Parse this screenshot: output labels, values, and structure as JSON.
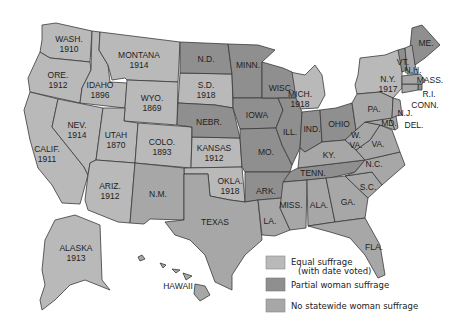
{
  "colors": {
    "equal": "#b9b9b9",
    "partial": "#8f8f8f",
    "none": "#a7a7a7",
    "border": "#3a3a3a",
    "background": "#ffffff"
  },
  "states": [
    {
      "abbr": "WASH.",
      "year": "1910",
      "status": "equal"
    },
    {
      "abbr": "ORE.",
      "year": "1912",
      "status": "equal"
    },
    {
      "abbr": "CALIF.",
      "year": "1911",
      "status": "equal"
    },
    {
      "abbr": "IDAHO",
      "year": "1896",
      "status": "equal"
    },
    {
      "abbr": "NEV.",
      "year": "1914",
      "status": "equal"
    },
    {
      "abbr": "MONTANA",
      "year": "1914",
      "status": "equal"
    },
    {
      "abbr": "WYO.",
      "year": "1869",
      "status": "equal"
    },
    {
      "abbr": "UTAH",
      "year": "1870",
      "status": "equal"
    },
    {
      "abbr": "COLO.",
      "year": "1893",
      "status": "equal"
    },
    {
      "abbr": "ARIZ.",
      "year": "1912",
      "status": "equal"
    },
    {
      "abbr": "N.M.",
      "year": "",
      "status": "none"
    },
    {
      "abbr": "N.D.",
      "year": "",
      "status": "partial"
    },
    {
      "abbr": "S.D.",
      "year": "1918",
      "status": "equal"
    },
    {
      "abbr": "NEBR.",
      "year": "",
      "status": "partial"
    },
    {
      "abbr": "KANSAS",
      "year": "1912",
      "status": "equal"
    },
    {
      "abbr": "OKLA.",
      "year": "1918",
      "status": "equal"
    },
    {
      "abbr": "TEXAS",
      "year": "",
      "status": "none"
    },
    {
      "abbr": "MINN.",
      "year": "",
      "status": "partial"
    },
    {
      "abbr": "IOWA",
      "year": "",
      "status": "partial"
    },
    {
      "abbr": "MO.",
      "year": "",
      "status": "partial"
    },
    {
      "abbr": "ARK.",
      "year": "",
      "status": "partial"
    },
    {
      "abbr": "LA.",
      "year": "",
      "status": "none"
    },
    {
      "abbr": "WISC.",
      "year": "",
      "status": "partial"
    },
    {
      "abbr": "ILL.",
      "year": "",
      "status": "partial"
    },
    {
      "abbr": "MICH.",
      "year": "1918",
      "status": "equal"
    },
    {
      "abbr": "IND.",
      "year": "",
      "status": "partial"
    },
    {
      "abbr": "OHIO",
      "year": "",
      "status": "partial"
    },
    {
      "abbr": "KY.",
      "year": "",
      "status": "none"
    },
    {
      "abbr": "TENN.",
      "year": "",
      "status": "partial"
    },
    {
      "abbr": "MISS.",
      "year": "",
      "status": "none"
    },
    {
      "abbr": "ALA.",
      "year": "",
      "status": "none"
    },
    {
      "abbr": "GA.",
      "year": "",
      "status": "none"
    },
    {
      "abbr": "FLA.",
      "year": "",
      "status": "none"
    },
    {
      "abbr": "S.C.",
      "year": "",
      "status": "none"
    },
    {
      "abbr": "N.C.",
      "year": "",
      "status": "none"
    },
    {
      "abbr": "VA.",
      "year": "",
      "status": "none"
    },
    {
      "abbr": "W. VA.",
      "year": "",
      "status": "none"
    },
    {
      "abbr": "MD.",
      "year": "",
      "status": "none"
    },
    {
      "abbr": "DEL.",
      "year": "",
      "status": "none"
    },
    {
      "abbr": "PA.",
      "year": "",
      "status": "none"
    },
    {
      "abbr": "N.J.",
      "year": "",
      "status": "none"
    },
    {
      "abbr": "N.Y.",
      "year": "1917",
      "status": "equal"
    },
    {
      "abbr": "CONN.",
      "year": "",
      "status": "none"
    },
    {
      "abbr": "R.I.",
      "year": "",
      "status": "partial"
    },
    {
      "abbr": "MASS.",
      "year": "",
      "status": "none"
    },
    {
      "abbr": "VT.",
      "year": "",
      "status": "partial"
    },
    {
      "abbr": "N.H.",
      "year": "",
      "status": "none"
    },
    {
      "abbr": "ME.",
      "year": "",
      "status": "partial"
    },
    {
      "abbr": "ALASKA",
      "year": "1913",
      "status": "equal"
    },
    {
      "abbr": "HAWAII",
      "year": "",
      "status": "none"
    }
  ],
  "labels": {
    "wash": "WASH.",
    "wash_y": "1910",
    "ore": "ORE.",
    "ore_y": "1912",
    "calif": "CALIF.",
    "calif_y": "1911",
    "idaho": "IDAHO",
    "idaho_y": "1896",
    "nev": "NEV.",
    "nev_y": "1914",
    "mont": "MONTANA",
    "mont_y": "1914",
    "wyo": "WYO.",
    "wyo_y": "1869",
    "utah": "UTAH",
    "utah_y": "1870",
    "colo": "COLO.",
    "colo_y": "1893",
    "ariz": "ARIZ.",
    "ariz_y": "1912",
    "nm": "N.M.",
    "nd": "N.D.",
    "sd": "S.D.",
    "sd_y": "1918",
    "nebr": "NEBR.",
    "kansas": "KANSAS",
    "kansas_y": "1912",
    "okla": "OKLA.",
    "okla_y": "1918",
    "texas": "TEXAS",
    "minn": "MINN.",
    "iowa": "IOWA",
    "mo": "MO.",
    "ark": "ARK.",
    "la": "LA.",
    "wisc": "WISC.",
    "ill": "ILL.",
    "mich": "MICH.",
    "mich_y": "1918",
    "ind": "IND.",
    "ohio": "OHIO",
    "ky": "KY.",
    "tenn": "TENN.",
    "miss": "MISS.",
    "ala": "ALA.",
    "ga": "GA.",
    "fla": "FLA.",
    "sc": "S.C.",
    "nc": "N.C.",
    "va": "VA.",
    "wva1": "W.",
    "wva2": "VA.",
    "md": "MD.",
    "del": "DEL.",
    "pa": "PA.",
    "nj": "N.J.",
    "ny": "N.Y.",
    "ny_y": "1917",
    "conn": "CONN.",
    "ri": "R.I.",
    "mass": "MASS.",
    "vt": "VT.",
    "nh": "N.H.",
    "me": "ME.",
    "alaska": "ALASKA",
    "alaska_y": "1913",
    "hawaii": "HAWAII"
  },
  "legend": {
    "items": [
      {
        "label": "Equal suffrage",
        "sublabel": "(with date voted)",
        "status": "equal"
      },
      {
        "label": "Partial woman suffrage",
        "status": "partial"
      },
      {
        "label": "No statewide woman suffrage",
        "status": "none"
      }
    ]
  }
}
